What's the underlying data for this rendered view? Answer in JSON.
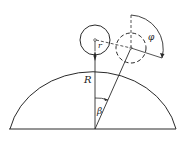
{
  "diagram": {
    "labels": {
      "big_radius": "R",
      "small_radius": "r",
      "position_angle": "β",
      "rotation_angle": "φ"
    },
    "colors": {
      "stroke": "#2a2a2a",
      "background": "#ffffff"
    }
  }
}
